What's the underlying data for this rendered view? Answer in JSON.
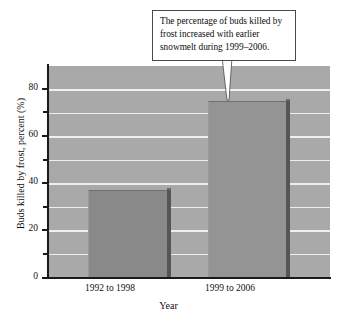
{
  "figure": {
    "annotation": "The percentage of buds killed by frost increased with earlier snowmelt during 1999–2006."
  },
  "chart_data": {
    "type": "bar",
    "title": "",
    "categories": [
      "1992 to 1998",
      "1999 to 2006"
    ],
    "values": [
      37,
      75
    ],
    "xlabel": "Year",
    "ylabel": "Buds killed by frost, percent (%)",
    "ylim": [
      0,
      90
    ],
    "yticks": [
      0,
      20,
      40,
      60,
      80
    ],
    "ytick_labels": [
      "0",
      "20",
      "40",
      "60",
      "80"
    ],
    "yminor_ticks": [
      10,
      30,
      50,
      70
    ],
    "grid": true,
    "gridlines": [
      10,
      20,
      30,
      40,
      50,
      60,
      70,
      80
    ],
    "legend": "none",
    "annotations": [
      {
        "text": "The percentage of buds killed by frost increased with earlier snowmelt during 1999–2006.",
        "points_to_category": "1999 to 2006"
      }
    ],
    "colors": {
      "plot_background": "#a9a9a9",
      "gridline": "#efefef",
      "bar_1": "#898989",
      "bar_2": "#949494",
      "bar_side": "#555555",
      "axis": "#1a1a1a",
      "text": "#101010",
      "callout_background": "#ffffff",
      "callout_border": "#4a4a4a"
    }
  }
}
